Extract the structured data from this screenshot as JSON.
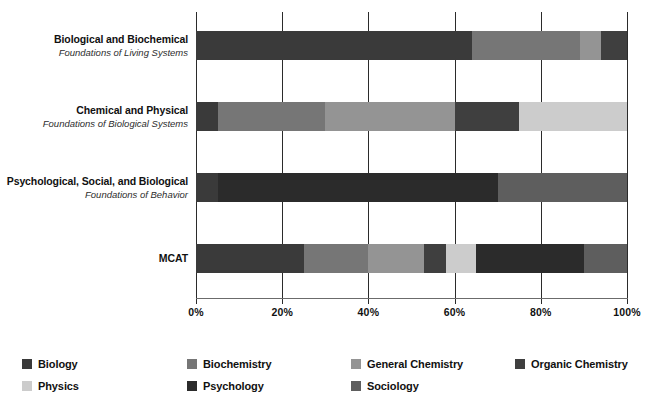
{
  "chart_data": {
    "type": "bar",
    "subtype": "stacked-horizontal-100pct",
    "title": "",
    "xlabel": "",
    "ylabel": "",
    "xlim": [
      0,
      100
    ],
    "xticks": [
      "0%",
      "20%",
      "40%",
      "60%",
      "80%",
      "100%"
    ],
    "xtick_values": [
      0,
      20,
      40,
      60,
      80,
      100
    ],
    "grid": true,
    "legend_position": "bottom",
    "categories": [
      "Biological and Biochemical",
      "Chemical and Physical",
      "Psychological, Social, and Biological",
      "MCAT"
    ],
    "category_subtitles": [
      "Foundations of Living Systems",
      "Foundations of Biological Systems",
      "Foundations of Behavior",
      ""
    ],
    "series": [
      {
        "name": "Biology",
        "color": "#3a3a3a",
        "values": [
          64,
          5,
          5,
          25
        ]
      },
      {
        "name": "Biochemistry",
        "color": "#767676",
        "values": [
          25,
          25,
          0,
          15
        ]
      },
      {
        "name": "General Chemistry",
        "color": "#949494",
        "values": [
          5,
          30,
          0,
          13
        ]
      },
      {
        "name": "Organic Chemistry",
        "color": "#3f3f3f",
        "values": [
          6,
          15,
          0,
          5
        ]
      },
      {
        "name": "Physics",
        "color": "#cccccc",
        "values": [
          0,
          25,
          0,
          7
        ]
      },
      {
        "name": "Psychology",
        "color": "#2b2b2b",
        "values": [
          0,
          0,
          65,
          25
        ]
      },
      {
        "name": "Sociology",
        "color": "#5e5e5e",
        "values": [
          0,
          0,
          30,
          10
        ]
      }
    ]
  },
  "legend": {
    "items": [
      {
        "label": "Biology",
        "color": "#3a3a3a"
      },
      {
        "label": "Biochemistry",
        "color": "#767676"
      },
      {
        "label": "General Chemistry",
        "color": "#949494"
      },
      {
        "label": "Organic Chemistry",
        "color": "#3f3f3f"
      },
      {
        "label": "Physics",
        "color": "#cccccc"
      },
      {
        "label": "Psychology",
        "color": "#2b2b2b"
      },
      {
        "label": "Sociology",
        "color": "#5e5e5e"
      }
    ]
  }
}
